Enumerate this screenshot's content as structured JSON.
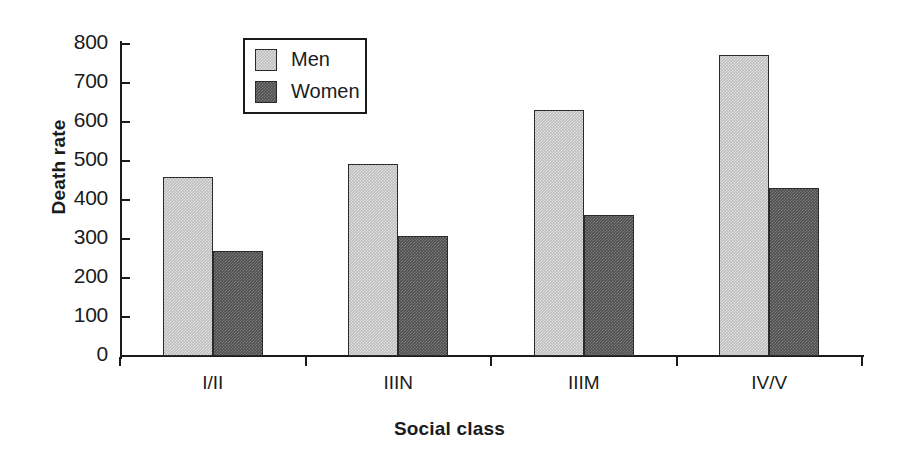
{
  "chart_data": {
    "type": "bar",
    "title": "",
    "xlabel": "Social class",
    "ylabel": "Death rate",
    "categories": [
      "I/II",
      "IIIN",
      "IIIM",
      "IV/V"
    ],
    "series": [
      {
        "name": "Men",
        "values": [
          458,
          492,
          632,
          772
        ],
        "color": "#bdbdbd"
      },
      {
        "name": "Women",
        "values": [
          268,
          308,
          362,
          432
        ],
        "color": "#4f4f4f"
      }
    ],
    "ylim": [
      0,
      800
    ],
    "yticks": [
      0,
      100,
      200,
      300,
      400,
      500,
      600,
      700,
      800
    ],
    "ytick_labels": [
      "0",
      "100",
      "200",
      "300",
      "400",
      "500",
      "600",
      "700",
      "800"
    ],
    "grid": false,
    "legend_position": "top-center",
    "legend_entries": [
      "Men",
      "Women"
    ],
    "axis_color": "#1b1b1b",
    "background": "#ffffff"
  }
}
